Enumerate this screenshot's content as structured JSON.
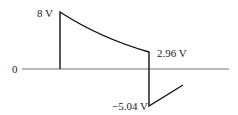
{
  "diagram": {
    "type": "voltage-waveform",
    "labels": {
      "origin": "0",
      "peak": "8 V",
      "end_positive": "2.96 V",
      "min": "−5.04 V"
    },
    "colors": {
      "waveform": "#111111",
      "axis": "#777777",
      "text": "#222222"
    }
  }
}
